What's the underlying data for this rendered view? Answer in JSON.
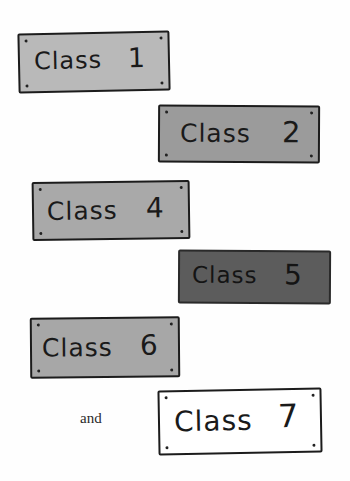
{
  "signs": [
    {
      "label": "Class",
      "number": "1",
      "bg": "#b9b9b9"
    },
    {
      "label": "Class",
      "number": "2",
      "bg": "#9b9b9b"
    },
    {
      "label": "Class",
      "number": "4",
      "bg": "#a9a9a9"
    },
    {
      "label": "Class",
      "number": "5",
      "bg": "#5c5c5c"
    },
    {
      "label": "Class",
      "number": "6",
      "bg": "#a7a7a7"
    },
    {
      "label": "Class",
      "number": "7",
      "bg": "#ffffff"
    }
  ],
  "connector": "and"
}
